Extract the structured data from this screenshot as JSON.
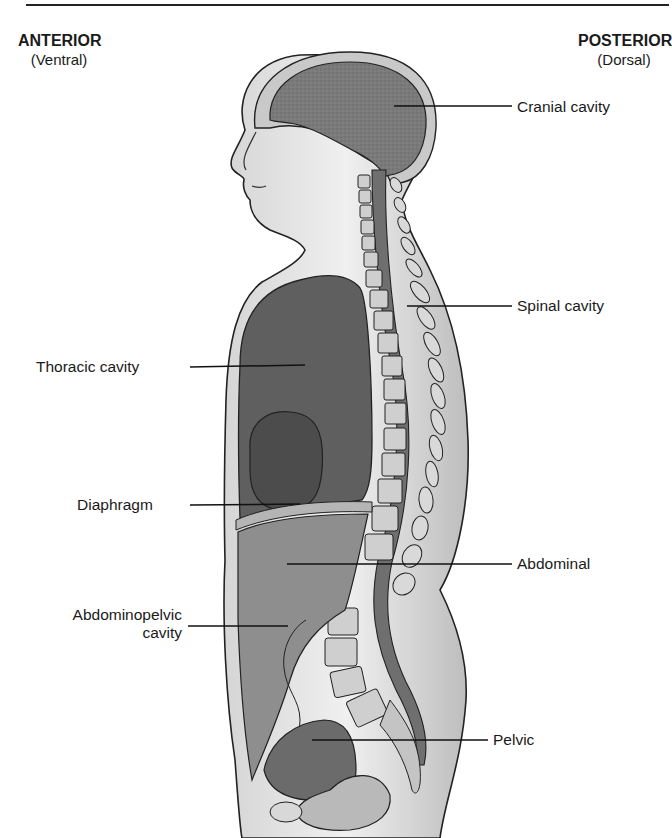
{
  "figure": {
    "type": "anatomical-diagram"
  },
  "orientation": {
    "anterior": {
      "label": "ANTERIOR",
      "sublabel": "(Ventral)"
    },
    "posterior": {
      "label": "POSTERIOR",
      "sublabel": "(Dorsal)"
    }
  },
  "labels": {
    "cranial": "Cranial cavity",
    "spinal": "Spinal cavity",
    "thoracic": "Thoracic cavity",
    "diaphragm": "Diaphragm",
    "abdominal": "Abdominal",
    "abdominopelvic_line1": "Abdominopelvic",
    "abdominopelvic_line2": "cavity",
    "pelvic": "Pelvic"
  },
  "colors": {
    "ink": "#1a1a1a",
    "skin": "#e6e6e6",
    "cavity_dark": "#6a6a6a",
    "cavity_mid": "#8c8c8c",
    "cavity_light": "#a9a9a9",
    "bone": "#c8c8c8"
  }
}
